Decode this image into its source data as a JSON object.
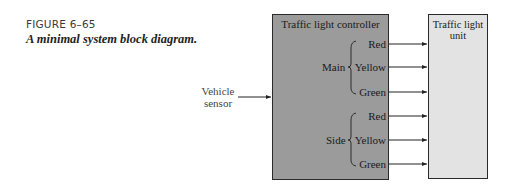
{
  "figure": {
    "label": "FIGURE 6–65",
    "caption": "A minimal system block diagram."
  },
  "diagram": {
    "input": {
      "label_line1": "Vehicle",
      "label_line2": "sensor"
    },
    "controller": {
      "title": "Traffic light controller",
      "fill": "#9b9b9b"
    },
    "unit": {
      "title_line1": "Traffic light",
      "title_line2": "unit",
      "fill": "#e3e3e3"
    },
    "groups": [
      {
        "name": "Main",
        "signals": [
          "Red",
          "Yellow",
          "Green"
        ]
      },
      {
        "name": "Side",
        "signals": [
          "Red",
          "Yellow",
          "Green"
        ]
      }
    ]
  }
}
